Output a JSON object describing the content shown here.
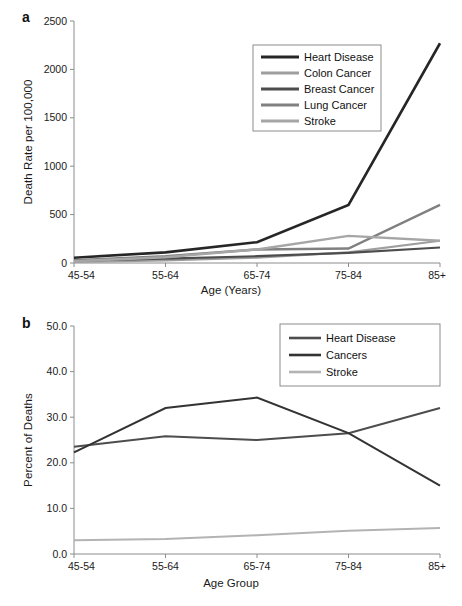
{
  "figure": {
    "background": "#ffffff"
  },
  "panels": [
    {
      "letter": "a",
      "ylabel": "Death Rate per 100,000",
      "xlabel": "Age (Years)",
      "ytick_labels": [
        "0",
        "500",
        "1000",
        "1500",
        "2000",
        "2500"
      ],
      "xtick_labels": [
        "45-54",
        "55-64",
        "65-74",
        "75-84",
        "85+"
      ],
      "legend_labels": [
        "Heart Disease",
        "Colon Cancer",
        "Breast Cancer",
        "Lung Cancer",
        "Stroke"
      ]
    },
    {
      "letter": "b",
      "ylabel": "Percent of Deaths",
      "xlabel": "Age Group",
      "ytick_labels": [
        "0.0",
        "10.0",
        "20.0",
        "30.0",
        "40.0",
        "50.0"
      ],
      "xtick_labels": [
        "45-54",
        "55-64",
        "65-74",
        "75-84",
        "85+"
      ],
      "legend_labels": [
        "Heart Disease",
        "Cancers",
        "Stroke"
      ]
    }
  ],
  "chart_data": [
    {
      "type": "line",
      "panel": "a",
      "title": "",
      "xlabel": "Age (Years)",
      "ylabel": "Death Rate per 100,000",
      "categories": [
        "45-54",
        "55-64",
        "65-74",
        "75-84",
        "85+"
      ],
      "ylim": [
        0,
        2500
      ],
      "yticks": [
        0,
        500,
        1000,
        1500,
        2000,
        2500
      ],
      "grid": false,
      "legend_position": "upper-center",
      "series": [
        {
          "name": "Heart Disease",
          "color": "#262626",
          "width": 2.6,
          "values": [
            55,
            110,
            215,
            600,
            2270
          ]
        },
        {
          "name": "Colon Cancer",
          "color": "#9e9e9e",
          "width": 2.2,
          "values": [
            12,
            28,
            55,
            110,
            230
          ]
        },
        {
          "name": "Breast Cancer",
          "color": "#4d4d4d",
          "width": 2.2,
          "values": [
            25,
            45,
            70,
            105,
            160
          ]
        },
        {
          "name": "Lung Cancer",
          "color": "#808080",
          "width": 2.4,
          "values": [
            30,
            70,
            140,
            150,
            600
          ]
        },
        {
          "name": "Stroke",
          "color": "#a6a6a6",
          "width": 2.4,
          "values": [
            18,
            60,
            140,
            280,
            230
          ]
        }
      ]
    },
    {
      "type": "line",
      "panel": "b",
      "title": "",
      "xlabel": "Age Group",
      "ylabel": "Percent of Deaths",
      "categories": [
        "45-54",
        "55-64",
        "65-74",
        "75-84",
        "85+"
      ],
      "ylim": [
        0,
        50
      ],
      "yticks": [
        0,
        10,
        20,
        30,
        40,
        50
      ],
      "grid": false,
      "legend_position": "upper-right",
      "series": [
        {
          "name": "Heart Disease",
          "color": "#4d4d4d",
          "width": 2.0,
          "values": [
            23.5,
            25.8,
            25.0,
            26.5,
            32.0
          ]
        },
        {
          "name": "Cancers",
          "color": "#333333",
          "width": 2.0,
          "values": [
            22.3,
            32.0,
            34.3,
            26.5,
            15.0
          ]
        },
        {
          "name": "Stroke",
          "color": "#b3b3b3",
          "width": 2.0,
          "values": [
            3.0,
            3.3,
            4.1,
            5.1,
            5.7
          ]
        }
      ]
    }
  ]
}
